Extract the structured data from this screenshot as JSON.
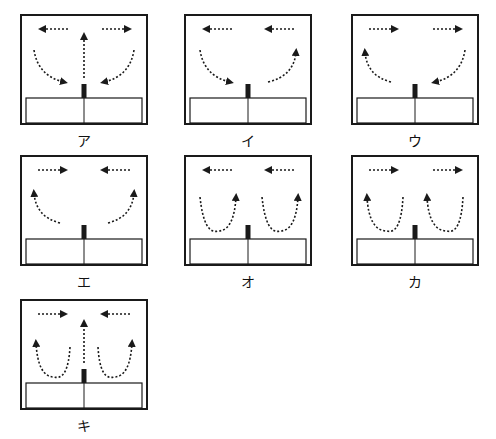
{
  "header": {
    "caption_cropped": ""
  },
  "panels": [
    {
      "id": "a",
      "label": "ア",
      "top_arrows": [
        "left",
        "right"
      ],
      "center_up_arrow": true,
      "side_flows": "down-inward",
      "description": "Top arrows point outward; side arrows curve downward toward the center; central arrow points up"
    },
    {
      "id": "i",
      "label": "イ",
      "top_arrows": [
        "left",
        "left"
      ],
      "center_up_arrow": false,
      "side_flows": "left-down-inward, right-up-outward",
      "description": "Both top arrows point left; left side curves down toward center; right side curves up outward"
    },
    {
      "id": "u",
      "label": "ウ",
      "top_arrows": [
        "right",
        "right"
      ],
      "center_up_arrow": false,
      "side_flows": "left-up-outward, right-down-inward",
      "description": "Both top arrows point right; left side curves up outward; right side curves down toward center"
    },
    {
      "id": "e",
      "label": "エ",
      "top_arrows": [
        "right",
        "left"
      ],
      "center_up_arrow": false,
      "side_flows": "up-outward",
      "description": "Top arrows point inward; both side arrows curve upward outward from the center"
    },
    {
      "id": "o",
      "label": "オ",
      "top_arrows": [
        "left",
        "left"
      ],
      "center_up_arrow": false,
      "side_flows": "u-loops-right-up",
      "description": "Both top arrows point left; two U-shaped loops rising on their right side"
    },
    {
      "id": "ka",
      "label": "カ",
      "top_arrows": [
        "right",
        "right"
      ],
      "center_up_arrow": false,
      "side_flows": "u-loops-left-up",
      "description": "Both top arrows point right; two U-shaped loops rising on their left side"
    },
    {
      "id": "ki",
      "label": "キ",
      "top_arrows": [
        "right",
        "left"
      ],
      "center_up_arrow": true,
      "side_flows": "u-loops-outer-up",
      "description": "Top arrows point inward; central arrow points up; two U-shaped loops rising on outer sides"
    }
  ],
  "colors": {
    "stroke": "#1a1a1a",
    "background": "#ffffff"
  }
}
